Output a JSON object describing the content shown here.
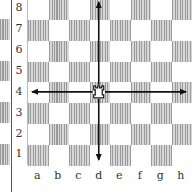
{
  "diagram": {
    "files": [
      "a",
      "b",
      "c",
      "d",
      "e",
      "f",
      "g",
      "h"
    ],
    "ranks": [
      "8",
      "7",
      "6",
      "5",
      "4",
      "3",
      "2",
      "1"
    ],
    "piece": {
      "type": "rook",
      "color": "white",
      "square": "d4",
      "icon": "white-rook-icon",
      "glyph": "♖"
    },
    "arrows": [
      {
        "direction": "up",
        "from": "d4",
        "to": "d8"
      },
      {
        "direction": "down",
        "from": "d4",
        "to": "d1"
      },
      {
        "direction": "left",
        "from": "d4",
        "to": "a4"
      },
      {
        "direction": "right",
        "from": "d4",
        "to": "h4"
      }
    ],
    "colors": {
      "dark_square": "#9a9a9a",
      "light_square": "#ffffff",
      "arrow": "#111111"
    }
  }
}
